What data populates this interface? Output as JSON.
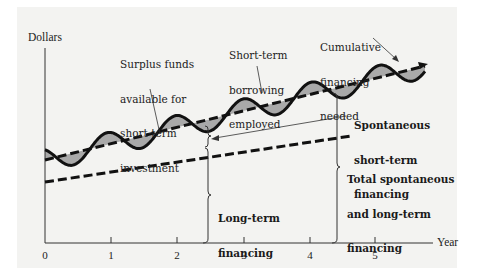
{
  "chart_data": {
    "type": "line",
    "title": "",
    "xlabel": "Year",
    "ylabel": "Dollars",
    "x_ticks": [
      "0",
      "1",
      "2",
      "3",
      "4",
      "5"
    ],
    "xlim": [
      0,
      5.8
    ],
    "grid": false,
    "series": [
      {
        "name": "Cumulative financing needed",
        "style": "solid wavy",
        "description": "Oscillates seasonally around the total spontaneous and long-term financing line, rising over time"
      },
      {
        "name": "Total spontaneous and long-term financing",
        "style": "dashed",
        "description": "Upper upward-sloping dashed line"
      },
      {
        "name": "Long-term financing",
        "style": "dashed",
        "description": "Lower upward-sloping dashed line"
      }
    ],
    "shaded_regions": [
      {
        "name": "Surplus funds available for short-term investment",
        "position": "wave below upper dashed line"
      },
      {
        "name": "Short-term borrowing employed",
        "position": "wave above upper dashed line"
      }
    ]
  },
  "axes": {
    "y_label": "Dollars",
    "x_label": "Year",
    "ticks": [
      "0",
      "1",
      "2",
      "3",
      "4",
      "5"
    ]
  },
  "annotations": {
    "surplus": [
      "Surplus funds",
      "available for",
      "short-term",
      "investment"
    ],
    "borrowing": [
      "Short-term",
      "borrowing",
      "employed"
    ],
    "cumulative": [
      "Cumulative",
      "financing",
      "needed"
    ],
    "spontaneous": [
      "Spontaneous",
      "short-term",
      "financing"
    ],
    "total": [
      "Total spontaneous",
      "and long-term",
      "financing"
    ],
    "long_term": [
      "Long-term",
      "financing"
    ]
  },
  "colors": {
    "panel_bg": "#f3f3f1",
    "line": "#111111",
    "shade": "#a9a9a9"
  }
}
